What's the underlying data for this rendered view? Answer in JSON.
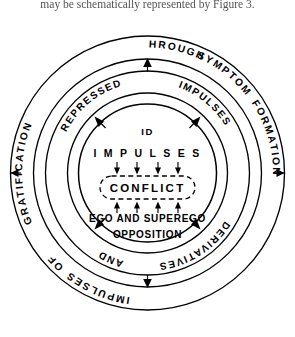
{
  "document": {
    "caption_line": "may be schematically represented by Figure 3."
  },
  "figure": {
    "name": "conflict-cycle-diagram",
    "type": "concentric-ring-diagram",
    "ring_count": 3,
    "stroke_color": "#000000",
    "background_color": "#ffffff"
  },
  "outer_ring": {
    "label": "GRATIFICATION OF IMPULSES THROUGH SYMPTOM FORMATION",
    "words": [
      "GRATIFICATION",
      "OF",
      "IMPULSES",
      "THROUGH",
      "SYMPTOM",
      "FORMATION"
    ],
    "arrows": [
      {
        "name": "outer-arrow-left",
        "direction": "left",
        "glyph": "◀"
      },
      {
        "name": "outer-arrow-right",
        "direction": "right",
        "glyph": "▶"
      }
    ]
  },
  "middle_ring": {
    "segments": [
      {
        "name": "middle-ring-label-repressed",
        "label": "REPRESSED",
        "position": "upper-left"
      },
      {
        "name": "middle-ring-label-impulses",
        "label": "IMPULSES",
        "position": "upper-right"
      },
      {
        "name": "middle-ring-label-and",
        "label": "AND",
        "position": "lower-left"
      },
      {
        "name": "middle-ring-label-derivatives",
        "label": "DERIVATIVES",
        "position": "lower-right"
      }
    ],
    "arrows": [
      {
        "name": "middle-arrow-top",
        "direction": "up",
        "glyph": "▲"
      },
      {
        "name": "middle-arrow-bottom",
        "direction": "down",
        "glyph": "▼"
      }
    ]
  },
  "inner_circle": {
    "id_label": "ID",
    "impulses_label": "I M P U L S E S",
    "conflict_label": "CONFLICT",
    "ego_label": "EGO AND SUPEREGO",
    "opposition_label": "OPPOSITION",
    "down_arrow_count": 4,
    "up_arrow_count": 4,
    "conflict_box_style": "dashed-rounded-rectangle",
    "arrows": [
      {
        "name": "inner-arrow-northwest",
        "direction": "up-left"
      },
      {
        "name": "inner-arrow-northeast",
        "direction": "up-right"
      },
      {
        "name": "inner-arrow-southwest",
        "direction": "down-left"
      },
      {
        "name": "inner-arrow-southeast",
        "direction": "down-right"
      }
    ]
  }
}
